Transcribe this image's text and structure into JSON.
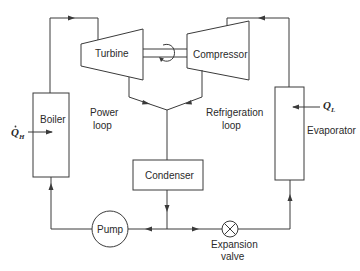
{
  "diagram": {
    "type": "combined power-refrigeration cycle schematic",
    "components": {
      "turbine": "Turbine",
      "compressor": "Compressor",
      "boiler": "Boiler",
      "condenser": "Condenser",
      "evaporator": "Evaporator",
      "pump": "Pump",
      "expansion_valve_line1": "Expansion",
      "expansion_valve_line2": "valve"
    },
    "loops": {
      "power_line1": "Power",
      "power_line2": "loop",
      "refrigeration_line1": "Refrigeration",
      "refrigeration_line2": "loop"
    },
    "heat": {
      "q_high_symbol": "Q",
      "q_high_sub": "H",
      "q_low_symbol": "Q",
      "q_low_sub": "L"
    },
    "colors": {
      "line": "#3a3a3a",
      "text": "#2a2a2a",
      "background": "#ffffff"
    }
  }
}
